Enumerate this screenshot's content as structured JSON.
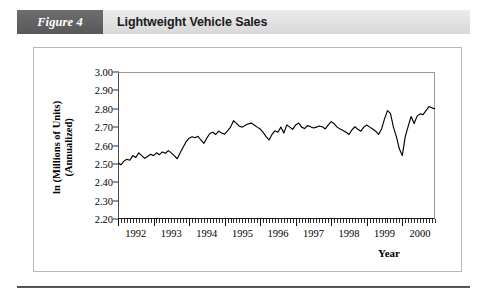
{
  "header": {
    "figure_number": "Figure 4",
    "title": "Lightweight Vehicle Sales",
    "figure_block_color": "#636365",
    "bar_color": "#e3e3e4"
  },
  "chart_data": {
    "type": "line",
    "title": "Lightweight Vehicle Sales",
    "xlabel": "Year",
    "ylabel": "ln (Millions of Units) (Annualized)",
    "ylabel_line1": "ln (Millions of Units)",
    "ylabel_line2": "(Annualized)",
    "ylim": [
      2.2,
      3.0
    ],
    "xlim": [
      1992.0,
      2000.92
    ],
    "ytick_labels": [
      "3.00",
      "2.90",
      "2.80",
      "2.70",
      "2.60",
      "2.50",
      "2.40",
      "2.30",
      "2.20"
    ],
    "ytick_values": [
      3.0,
      2.9,
      2.8,
      2.7,
      2.6,
      2.5,
      2.4,
      2.3,
      2.2
    ],
    "xtick_labels": [
      "1992",
      "1993",
      "1994",
      "1995",
      "1996",
      "1997",
      "1998",
      "1999",
      "2000"
    ],
    "xtick_values": [
      1992,
      1993,
      1994,
      1995,
      1996,
      1997,
      1998,
      1999,
      2000
    ],
    "x_minor_tick_interval": "monthly",
    "grid": false,
    "legend": null,
    "line_color": "#000000",
    "series": [
      {
        "name": "Lightweight Vehicle Sales",
        "x_start": 1992.0,
        "x_step": 0.08333,
        "values": [
          2.505,
          2.495,
          2.515,
          2.525,
          2.52,
          2.545,
          2.535,
          2.56,
          2.545,
          2.53,
          2.54,
          2.552,
          2.545,
          2.56,
          2.55,
          2.565,
          2.558,
          2.572,
          2.56,
          2.545,
          2.528,
          2.56,
          2.59,
          2.62,
          2.64,
          2.648,
          2.642,
          2.65,
          2.63,
          2.612,
          2.64,
          2.665,
          2.672,
          2.66,
          2.678,
          2.668,
          2.662,
          2.68,
          2.7,
          2.735,
          2.72,
          2.705,
          2.7,
          2.71,
          2.718,
          2.722,
          2.712,
          2.7,
          2.69,
          2.672,
          2.648,
          2.63,
          2.66,
          2.68,
          2.672,
          2.7,
          2.668,
          2.712,
          2.7,
          2.688,
          2.712,
          2.722,
          2.7,
          2.692,
          2.708,
          2.702,
          2.695,
          2.7,
          2.706,
          2.702,
          2.69,
          2.712,
          2.73,
          2.718,
          2.7,
          2.69,
          2.682,
          2.672,
          2.66,
          2.685,
          2.702,
          2.688,
          2.678,
          2.7,
          2.712,
          2.7,
          2.69,
          2.678,
          2.66,
          2.69,
          2.745,
          2.79,
          2.775,
          2.7,
          2.648,
          2.582,
          2.545,
          2.648,
          2.705,
          2.758,
          2.72,
          2.76,
          2.772,
          2.768,
          2.79,
          2.812,
          2.805,
          2.8,
          2.808,
          2.822,
          2.832,
          2.838,
          2.828,
          2.82,
          2.845,
          2.88,
          2.912,
          2.875,
          2.852,
          2.84,
          2.845,
          2.88,
          2.84,
          2.8,
          2.772,
          2.76
        ]
      }
    ]
  },
  "axis": {
    "x_title": "Year"
  }
}
